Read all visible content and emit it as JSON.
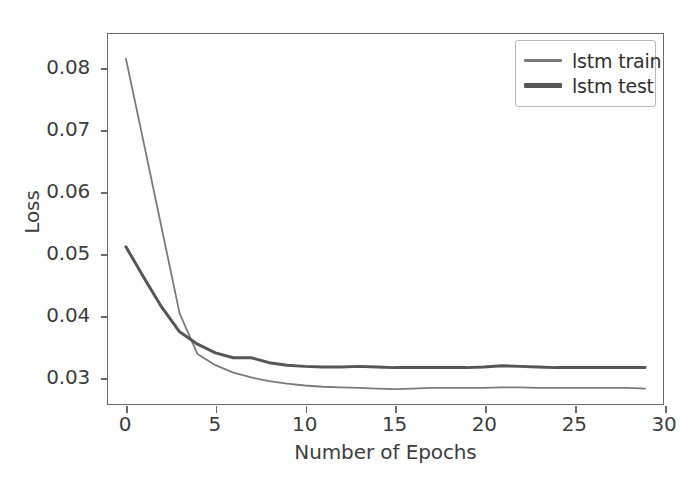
{
  "chart_data": {
    "type": "line",
    "title": "",
    "xlabel": "Number of Epochs",
    "ylabel": "Loss",
    "xlim": [
      -1.0,
      30.0
    ],
    "ylim": [
      0.0255,
      0.0855
    ],
    "xticks": [
      0,
      5,
      10,
      15,
      20,
      25,
      30
    ],
    "xtick_labels": [
      "0",
      "5",
      "10",
      "15",
      "20",
      "25",
      "30"
    ],
    "yticks": [
      0.03,
      0.04,
      0.05,
      0.06,
      0.07,
      0.08
    ],
    "ytick_labels": [
      "0.03",
      "0.04",
      "0.05",
      "0.06",
      "0.07",
      "0.08"
    ],
    "grid": false,
    "legend_position": "upper right",
    "x": [
      0,
      1,
      2,
      3,
      4,
      5,
      6,
      7,
      8,
      9,
      10,
      11,
      12,
      13,
      14,
      15,
      16,
      17,
      18,
      19,
      20,
      21,
      22,
      23,
      24,
      25,
      26,
      27,
      28,
      29
    ],
    "series": [
      {
        "name": "lstm train",
        "color": "#7a7a7a",
        "linewidth": 1.8,
        "values": [
          0.0815,
          0.0678,
          0.054,
          0.0402,
          0.0336,
          0.0318,
          0.0306,
          0.0298,
          0.0292,
          0.0288,
          0.0285,
          0.0283,
          0.0282,
          0.0281,
          0.028,
          0.0279,
          0.028,
          0.0281,
          0.0281,
          0.0281,
          0.0281,
          0.0282,
          0.0282,
          0.0281,
          0.0281,
          0.0281,
          0.0281,
          0.0281,
          0.0281,
          0.028
        ]
      },
      {
        "name": "lstm test",
        "color": "#565656",
        "linewidth": 3.0,
        "values": [
          0.051,
          0.046,
          0.0412,
          0.0372,
          0.0352,
          0.0338,
          0.033,
          0.033,
          0.0322,
          0.0318,
          0.0316,
          0.0315,
          0.0315,
          0.0316,
          0.0315,
          0.0314,
          0.0314,
          0.0314,
          0.0314,
          0.0314,
          0.0315,
          0.0317,
          0.0316,
          0.0315,
          0.0314,
          0.0314,
          0.0314,
          0.0314,
          0.0314,
          0.0314
        ]
      }
    ]
  },
  "legend": {
    "entries": [
      {
        "label": "lstm train"
      },
      {
        "label": "lstm test"
      }
    ]
  },
  "axes": {
    "x_title": "Number of Epochs",
    "y_title": "Loss"
  }
}
